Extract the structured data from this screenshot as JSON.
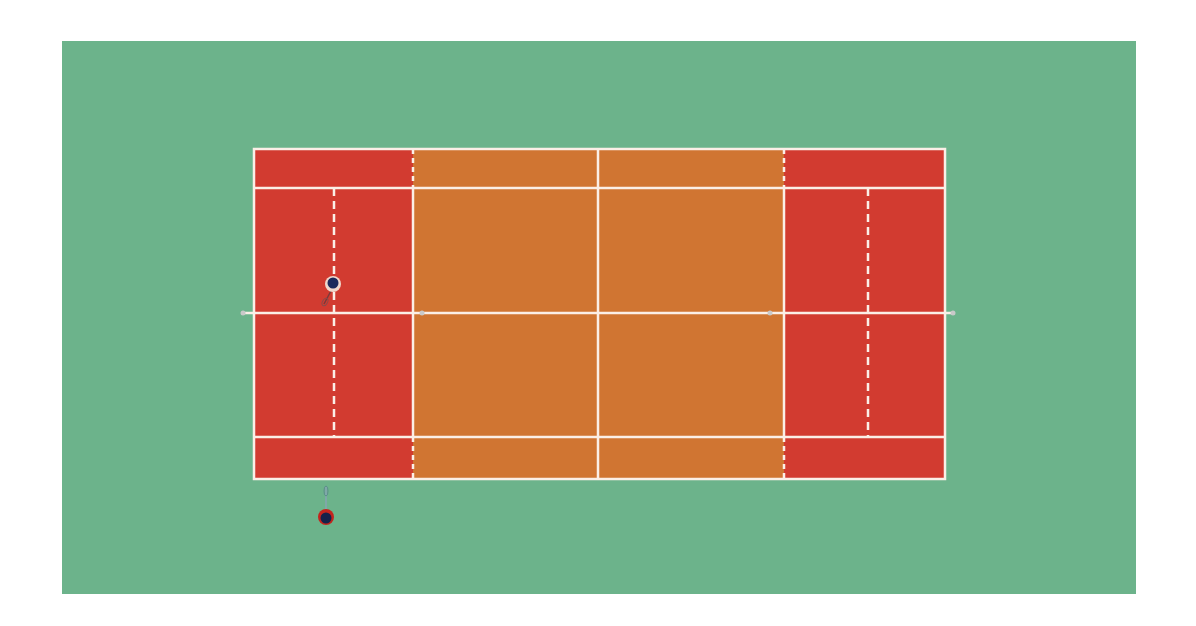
{
  "scene": {
    "type": "tennis-court-top-down",
    "canvas": {
      "width": 1196,
      "height": 626,
      "background": "#ffffff"
    },
    "surround": {
      "x": 62,
      "y": 41,
      "width": 1074,
      "height": 553,
      "color": "#6cb38b"
    },
    "court": {
      "outer": {
        "x1": 254,
        "y1": 149,
        "x2": 945,
        "y2": 479
      },
      "singles_y": [
        188,
        437
      ],
      "service_x": [
        413,
        784
      ],
      "center_x": 598,
      "center_y": 313,
      "inner_dashed_x": [
        334,
        868
      ],
      "net_posts": [
        243,
        953
      ],
      "center_marks": [
        422,
        770
      ]
    },
    "colors": {
      "backcourt": "#d23b30",
      "midcourt": "#d07532",
      "lines": "#fbefe7",
      "net_post": "#c9c9c9"
    },
    "players": [
      {
        "id": "player-1",
        "x": 333,
        "y": 284,
        "head_color": "#1b2a5c",
        "ring_color": "#f0d8cc",
        "racket_dir": "down-left"
      },
      {
        "id": "player-2",
        "x": 326,
        "y": 517,
        "head_color": "#14214a",
        "ring_color": "#c3241d",
        "racket_dir": "up"
      }
    ]
  }
}
